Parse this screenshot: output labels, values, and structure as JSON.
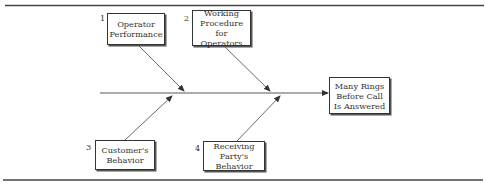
{
  "diagram": {
    "type": "fishbone (cause-and-effect)",
    "effect": {
      "label": "Many Rings Before Call Is Answered"
    },
    "causes": [
      {
        "number": "1",
        "label": "Operator Performance",
        "position": "top"
      },
      {
        "number": "2",
        "label": "Working Procedure for Operators",
        "position": "top"
      },
      {
        "number": "3",
        "label": "Customer's Behavior",
        "position": "bottom"
      },
      {
        "number": "4",
        "label": "Receiving Party's Behavior",
        "position": "bottom"
      }
    ],
    "colors": {
      "line": "#333333",
      "background": "#ffffff"
    }
  }
}
